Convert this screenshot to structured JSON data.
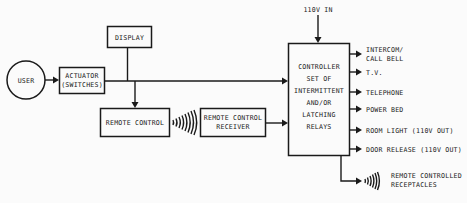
{
  "diagram": {
    "type": "block-diagram",
    "nodes": {
      "user": {
        "label": "USER"
      },
      "actuator": {
        "line1": "ACTUATOR",
        "line2": "(SWITCHES)"
      },
      "display": {
        "label": "DISPLAY"
      },
      "remote_control": {
        "label": "REMOTE CONTROL"
      },
      "remote_receiver": {
        "line1": "REMOTE CONTROL",
        "line2": "RECEIVER"
      },
      "controller": {
        "lines": [
          "CONTROLLER",
          "SET OF",
          "INTERMITTENT",
          "AND/OR",
          "LATCHING",
          "RELAYS"
        ]
      },
      "power_in": {
        "label": "110V IN"
      }
    },
    "outputs": [
      {
        "line1": "INTERCOM/",
        "line2": "CALL BELL"
      },
      {
        "line1": "T.V.",
        "line2": ""
      },
      {
        "line1": "TELEPHONE",
        "line2": ""
      },
      {
        "line1": "POWER BED",
        "line2": ""
      },
      {
        "line1": "ROOM LIGHT (110V OUT)",
        "line2": ""
      },
      {
        "line1": "DOOR RELEASE (110V OUT)",
        "line2": ""
      }
    ],
    "wireless_output": {
      "line1": "REMOTE CONTROLLED",
      "line2": "RECEPTACLES"
    },
    "edges": [
      [
        "USER",
        "ACTUATOR (SWITCHES)"
      ],
      [
        "ACTUATOR (SWITCHES)",
        "CONTROLLER"
      ],
      [
        "DISPLAY",
        "main bus"
      ],
      [
        "main bus",
        "REMOTE CONTROL"
      ],
      [
        "REMOTE CONTROL",
        "REMOTE CONTROL RECEIVER (wireless)"
      ],
      [
        "REMOTE CONTROL RECEIVER",
        "CONTROLLER"
      ],
      [
        "110V IN",
        "CONTROLLER"
      ],
      [
        "CONTROLLER",
        "outputs"
      ],
      [
        "CONTROLLER",
        "REMOTE CONTROLLED RECEPTACLES (wireless)"
      ]
    ]
  }
}
